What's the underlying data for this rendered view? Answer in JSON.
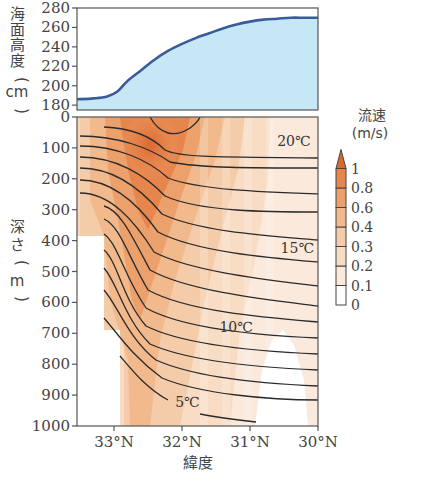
{
  "chart_data": [
    {
      "type": "area",
      "panel": "top",
      "title": "",
      "ylabel": "海面高度(cm)",
      "xlabel": "",
      "ylim": [
        175,
        280
      ],
      "yticks": [
        180,
        200,
        220,
        240,
        260,
        280
      ],
      "xlim": [
        33.55,
        30.0
      ],
      "x": [
        33.55,
        33.3,
        33.1,
        32.95,
        32.8,
        32.6,
        32.4,
        32.2,
        32.0,
        31.8,
        31.6,
        31.4,
        31.2,
        31.0,
        30.8,
        30.6,
        30.4,
        30.2,
        30.0
      ],
      "series": [
        {
          "name": "海面高度",
          "values": [
            186,
            187,
            189,
            194,
            205,
            216,
            227,
            236,
            243,
            249,
            254,
            259,
            263,
            266,
            268,
            269,
            270,
            270,
            270
          ]
        }
      ],
      "fill_color": "#c6e8f6",
      "line_color": "#3a5a9a"
    },
    {
      "type": "heatmap",
      "panel": "bottom",
      "title": "",
      "xlabel": "緯度",
      "ylabel": "深さ(m)",
      "xticks": [
        "33°N",
        "32°N",
        "31°N",
        "30°N"
      ],
      "xtick_values": [
        33,
        32,
        31,
        30
      ],
      "yticks": [
        0,
        100,
        200,
        300,
        400,
        500,
        600,
        700,
        800,
        900,
        1000
      ],
      "ylim": [
        1000,
        0
      ],
      "xlim": [
        33.55,
        30.0
      ],
      "colorbar": {
        "title": "流速",
        "unit": "(m/s)",
        "levels": [
          "0",
          "0.1",
          "0.2",
          "0.3",
          "0.4",
          "0.6",
          "0.8",
          "1"
        ],
        "colors": [
          "#ffffff",
          "#fbe9db",
          "#f8dcc4",
          "#f5cca9",
          "#f1b98c",
          "#eca06c",
          "#e6854c",
          "#d9682f"
        ],
        "extend": "max"
      },
      "isotherm_labels": [
        {
          "text": "20℃",
          "lat": 30.6,
          "depth": 95
        },
        {
          "text": "15℃",
          "lat": 30.55,
          "depth": 440
        },
        {
          "text": "10℃",
          "lat": 31.45,
          "depth": 695
        },
        {
          "text": "5℃",
          "lat": 32.1,
          "depth": 940
        }
      ],
      "annotations": [
        "Kuroshio current speed cross-section with temperature isotherms at 1℃ interval"
      ]
    }
  ],
  "labels": {
    "top_ylabel_chars": [
      "海",
      "面",
      "高",
      "度",
      "（",
      "cm",
      "）"
    ],
    "bottom_ylabel_chars": [
      "深",
      "さ",
      "（",
      "m",
      "）"
    ],
    "xlabel": "緯度",
    "cb_title": "流速",
    "cb_unit": "(m/s)"
  }
}
